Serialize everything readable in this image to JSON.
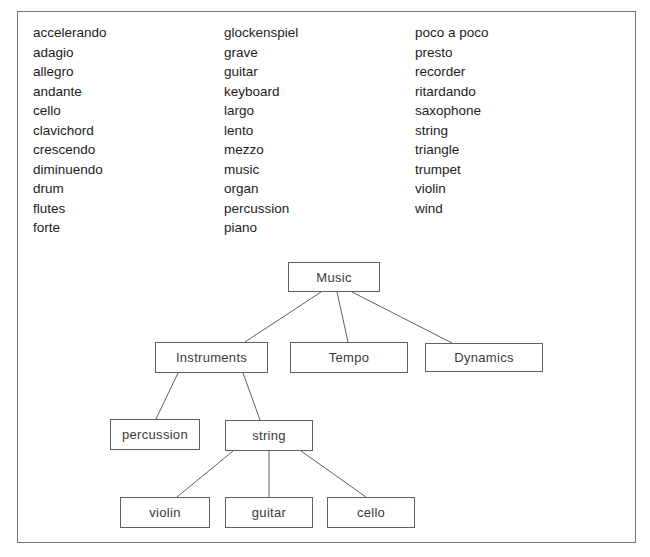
{
  "style": {
    "background": "#ffffff",
    "frame_border_color": "#757575",
    "connector_color": "#606060",
    "word_text_color": "#1c1c1c",
    "node_text_color": "#3a3a3a"
  },
  "word_list": {
    "columns": [
      {
        "items": [
          "accelerando",
          "adagio",
          "allegro",
          "andante",
          "cello",
          "clavichord",
          "crescendo",
          "diminuendo",
          "drum",
          "flutes",
          "forte"
        ]
      },
      {
        "items": [
          "glockenspiel",
          "grave",
          "guitar",
          "keyboard",
          "largo",
          "lento",
          "mezzo",
          "music",
          "organ",
          "percussion",
          "piano"
        ]
      },
      {
        "items": [
          "poco a poco",
          "presto",
          "recorder",
          "ritardando",
          "saxophone",
          "string",
          "triangle",
          "trumpet",
          "violin",
          "wind"
        ]
      }
    ]
  },
  "tree": {
    "type": "hierarchy",
    "root": "music",
    "nodes": {
      "music": {
        "label": "Music",
        "children": [
          "instruments",
          "tempo",
          "dynamics"
        ]
      },
      "instruments": {
        "label": "Instruments",
        "children": [
          "percussion",
          "string"
        ]
      },
      "tempo": {
        "label": "Tempo",
        "children": []
      },
      "dynamics": {
        "label": "Dynamics",
        "children": []
      },
      "percussion": {
        "label": "percussion",
        "children": []
      },
      "string": {
        "label": "string",
        "children": [
          "violin",
          "guitar",
          "cello"
        ]
      },
      "violin": {
        "label": "violin",
        "children": []
      },
      "guitar": {
        "label": "guitar",
        "children": []
      },
      "cello": {
        "label": "cello",
        "children": []
      }
    }
  }
}
